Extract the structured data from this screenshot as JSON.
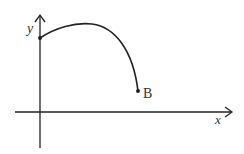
{
  "diagram": {
    "type": "function-graph",
    "axes": {
      "x_label": "x",
      "y_label": "y"
    },
    "points": [
      {
        "name": "start",
        "label": "",
        "on": "y-axis"
      },
      {
        "name": "B",
        "label": "B"
      }
    ],
    "curve": {
      "description": "curve starting on the positive y-axis, rising to a maximum, then descending to endpoint B above the x-axis"
    },
    "colors": {
      "stroke": "#222222",
      "background": "#ffffff"
    }
  }
}
